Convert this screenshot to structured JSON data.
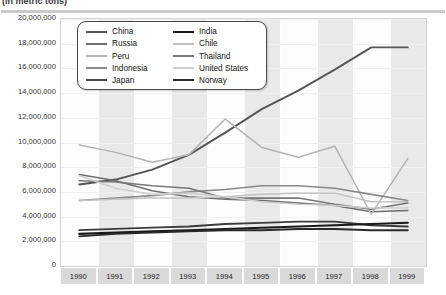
{
  "header": {
    "title": "(in metric tons)"
  },
  "chart_data": {
    "type": "line",
    "title": "(in metric tons)",
    "xlabel": "",
    "ylabel": "",
    "grid": true,
    "legend_position": "top-center",
    "x": [
      1990,
      1991,
      1992,
      1993,
      1994,
      1995,
      1996,
      1997,
      1998,
      1999
    ],
    "categories": [
      "1990",
      "1991",
      "1992",
      "1993",
      "1994",
      "1995",
      "1996",
      "1997",
      "1998",
      "1999"
    ],
    "ylim": [
      0,
      20000000
    ],
    "ytick_labels": [
      "20,000,000",
      "18,000,000",
      "16,000,000",
      "14,000,000",
      "12,000,000",
      "10,000,000",
      "8,000,000",
      "6,000,000",
      "4,000,000",
      "2,000,000",
      "0"
    ],
    "ytick_values": [
      20000000,
      18000000,
      16000000,
      14000000,
      12000000,
      10000000,
      8000000,
      6000000,
      4000000,
      2000000,
      0
    ],
    "series": [
      {
        "name": "China",
        "color": "#555555",
        "width": 1.9,
        "values": [
          6600000,
          7000000,
          7800000,
          9000000,
          10800000,
          12700000,
          14200000,
          15900000,
          17700000,
          17700000
        ]
      },
      {
        "name": "Russia",
        "color": "#6e6e6e",
        "width": 1.5,
        "values": [
          7400000,
          6900000,
          6100000,
          5600000,
          5400000,
          5300000,
          5100000,
          4900000,
          4400000,
          4500000
        ]
      },
      {
        "name": "Peru",
        "color": "#b4b4b4",
        "width": 1.5,
        "values": [
          9800000,
          9200000,
          8400000,
          9000000,
          11900000,
          9600000,
          8800000,
          9700000,
          4200000,
          8700000
        ]
      },
      {
        "name": "Indonesia",
        "color": "#8a8a8a",
        "width": 1.6,
        "values": [
          5300000,
          5500000,
          5700000,
          6000000,
          6200000,
          6500000,
          6500000,
          6300000,
          5800000,
          5300000
        ]
      },
      {
        "name": "Japan",
        "color": "#3c3c3c",
        "width": 1.8,
        "values": [
          2900000,
          3000000,
          3100000,
          3200000,
          3400000,
          3500000,
          3600000,
          3600000,
          3300000,
          3200000
        ]
      },
      {
        "name": "India",
        "color": "#1a1a1a",
        "width": 2.1,
        "values": [
          2600000,
          2700000,
          2800000,
          2900000,
          3000000,
          3100000,
          3200000,
          3300000,
          3400000,
          3500000
        ]
      },
      {
        "name": "Chile",
        "color": "#c2c2c2",
        "width": 1.5,
        "values": [
          5300000,
          5400000,
          5500000,
          5500000,
          5600000,
          5800000,
          5900000,
          5900000,
          5200000,
          5200000
        ]
      },
      {
        "name": "Thailand",
        "color": "#777777",
        "width": 1.6,
        "values": [
          6900000,
          6800000,
          6500000,
          6300000,
          5500000,
          5500000,
          5500000,
          5000000,
          4600000,
          5100000
        ]
      },
      {
        "name": "United States",
        "color": "#cfcfcf",
        "width": 1.6,
        "values": [
          7300000,
          6300000,
          5800000,
          5900000,
          5600000,
          5200000,
          5000000,
          4900000,
          4700000,
          4700000
        ]
      },
      {
        "name": "Norway",
        "color": "#2a2a2a",
        "width": 1.9,
        "values": [
          2400000,
          2600000,
          2700000,
          2800000,
          2900000,
          2900000,
          3000000,
          3000000,
          2900000,
          2900000
        ]
      }
    ]
  },
  "legend": {
    "columns": [
      [
        {
          "label": "China",
          "color": "#555555",
          "width": 2.2
        },
        {
          "label": "Russia",
          "color": "#6e6e6e",
          "width": 2.0
        },
        {
          "label": "Peru",
          "color": "#b4b4b4",
          "width": 2.0
        },
        {
          "label": "Indonesia",
          "color": "#8a8a8a",
          "width": 2.2
        },
        {
          "label": "Japan",
          "color": "#4a4a4a",
          "width": 2.2
        }
      ],
      [
        {
          "label": "India",
          "color": "#1a1a1a",
          "width": 2.6
        },
        {
          "label": "Chile",
          "color": "#c2c2c2",
          "width": 2.0
        },
        {
          "label": "Thailand",
          "color": "#777777",
          "width": 2.2
        },
        {
          "label": "United States",
          "color": "#cfcfcf",
          "width": 2.2
        },
        {
          "label": "Norway",
          "color": "#2a2a2a",
          "width": 2.6
        }
      ]
    ]
  }
}
